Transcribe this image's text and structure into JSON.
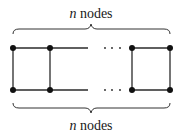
{
  "diagram": {
    "type": "ladder-graph",
    "top_label": {
      "var": "n",
      "text": " nodes"
    },
    "bottom_label": {
      "var": "n",
      "text": " nodes"
    },
    "ellipsis": "· · ·",
    "nodes_top": [
      13,
      50,
      132,
      170
    ],
    "nodes_bottom": [
      13,
      50,
      132,
      170
    ],
    "row_y": {
      "top": 48,
      "bottom": 90
    },
    "colors": {
      "stroke": "#2a2a2a",
      "node": "#111111",
      "background": "#ffffff"
    }
  }
}
